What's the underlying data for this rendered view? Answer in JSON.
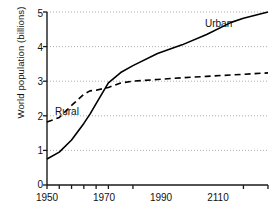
{
  "chart_data": {
    "type": "line",
    "title": "",
    "xlabel": "",
    "ylabel": "World population (billions)",
    "xlim": [
      1950,
      2130
    ],
    "ylim": [
      0,
      5
    ],
    "grid": true,
    "grid_axis": "y",
    "legend_position": "inline-annotations",
    "y_ticks": [
      "0",
      "1",
      "2",
      "3",
      "4",
      "5"
    ],
    "y_tick_values": [
      0,
      1,
      2,
      3,
      4,
      5
    ],
    "x_ticks": [
      "1950",
      "1970",
      "1990",
      "2110"
    ],
    "x_tick_values": [
      1950,
      1970,
      1990,
      2110
    ],
    "x_minor_tick_values": [
      1960,
      1980,
      2000,
      2020,
      2130
    ],
    "series": [
      {
        "name": "Urban",
        "style": "solid",
        "color": "#000000",
        "label_position": "upper-right",
        "x": [
          1950,
          1960,
          1970,
          1980,
          1985,
          1990,
          2000,
          2010,
          2020,
          2040,
          2060,
          2080,
          2100,
          2110,
          2130
        ],
        "values": [
          0.75,
          0.95,
          1.3,
          1.78,
          2.05,
          2.35,
          2.95,
          3.25,
          3.45,
          3.8,
          4.05,
          4.35,
          4.7,
          4.82,
          5.0
        ]
      },
      {
        "name": "Rural",
        "style": "dashed",
        "color": "#000000",
        "label_position": "left",
        "x": [
          1950,
          1960,
          1970,
          1980,
          1985,
          1990,
          2000,
          2010,
          2020,
          2040,
          2060,
          2080,
          2100,
          2110,
          2130
        ],
        "values": [
          1.82,
          1.95,
          2.3,
          2.62,
          2.72,
          2.74,
          2.82,
          2.95,
          3.0,
          3.05,
          3.1,
          3.14,
          3.18,
          3.2,
          3.24
        ]
      }
    ],
    "annotations": [
      {
        "text": "Urban",
        "x": 2075,
        "y": 4.78
      },
      {
        "text": "Rural",
        "x": 1957,
        "y": 2.18
      }
    ]
  },
  "axis_labels": {
    "y_title": "World population (billions)",
    "y0": "0",
    "y1": "1",
    "y2": "2",
    "y3": "3",
    "y4": "4",
    "y5": "5",
    "x0": "1950",
    "x1": "1970",
    "x2": "1990",
    "x3": "2110"
  },
  "series_labels": {
    "urban": "Urban",
    "rural": "Rural"
  }
}
